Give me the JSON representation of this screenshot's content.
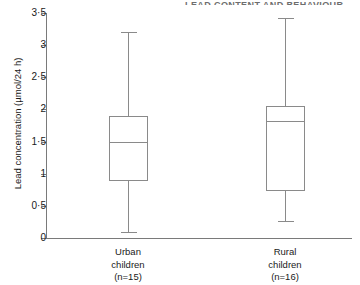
{
  "figure": {
    "top_cut_header": "LEAD CONTENT AND BEHAVIOUR",
    "axis_line_color": "#7a7a7a",
    "box_line_color": "#8a8a8a"
  },
  "chart_data": {
    "type": "box",
    "title": "",
    "xlabel": "",
    "ylabel": "Lead concentration (µmol/24 h)",
    "ylim": [
      0,
      3.5
    ],
    "ytick_labels": [
      "3·5",
      "3",
      "2·5",
      "2",
      "1·5",
      "1",
      "0·5",
      "0"
    ],
    "ytick_values": [
      3.5,
      3,
      2.5,
      2,
      1.5,
      1,
      0.5,
      0
    ],
    "grid": false,
    "legend": "none",
    "categories": [
      "Urban children (n=15)",
      "Rural children (n=16)"
    ],
    "category_lines": [
      [
        "Urban",
        "children",
        "(n=15)"
      ],
      [
        "Rural",
        "children",
        "(n=16)"
      ]
    ],
    "boxes": [
      {
        "name": "Urban children",
        "n": 15,
        "min": 0.1,
        "q1": 0.9,
        "median": 1.5,
        "q3": 1.9,
        "max": 3.2
      },
      {
        "name": "Rural children",
        "n": 16,
        "min": 0.27,
        "q1": 0.75,
        "median": 1.82,
        "q3": 2.05,
        "max": 3.42
      }
    ]
  }
}
